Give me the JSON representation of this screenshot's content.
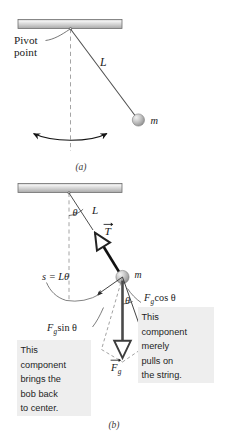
{
  "figure": {
    "colors": {
      "ceiling_light": "#e9e9e9",
      "ceiling_mid": "#c8c8c8",
      "ceiling_dark": "#9a9a9a",
      "ceiling_border": "#6e6e6e",
      "bob_light": "#e4e4e4",
      "bob_mid": "#b3b3b3",
      "bob_dark": "#8c8c8c",
      "line": "#4a4a4a",
      "dash": "#8e8e8e",
      "vector_black": "#1a1a1a",
      "callout_bg": "#eeeeee",
      "text": "#1a1a1a"
    },
    "panels": [
      {
        "id": "a",
        "caption": "(a)",
        "labels": {
          "pivot": "Pivot\npoint",
          "pivot_line1": "Pivot",
          "pivot_line2": "point",
          "length": "L",
          "mass": "m"
        },
        "swing_arrow": "double-headed-arc-arrow"
      },
      {
        "id": "b",
        "caption": "(b)",
        "labels": {
          "angle_top": "θ",
          "length": "L",
          "tension": "T",
          "arc_length": "s = Lθ",
          "mass": "m",
          "component_cos": "F₉ cos θ",
          "component_cos_base": "F",
          "component_cos_sub": "g",
          "component_cos_rest": "cos θ",
          "component_sin_base": "F",
          "component_sin_sub": "g",
          "component_sin_rest": "sin θ",
          "angle_bob": "θ",
          "gravity_base": "F",
          "gravity_sub": "g"
        },
        "callouts": [
          {
            "id": "left-callout",
            "lines": [
              "This",
              "component",
              "brings the",
              "bob back",
              "to center."
            ]
          },
          {
            "id": "right-callout",
            "lines": [
              "This",
              "component",
              "merely",
              "pulls on",
              "the string."
            ]
          }
        ]
      }
    ]
  }
}
